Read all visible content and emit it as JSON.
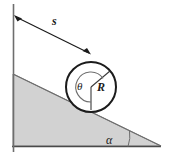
{
  "figure": {
    "kind": "physics-diagram",
    "background_color": "#ffffff",
    "line_color": "#1b1b1b",
    "incline_fill_color": "#d2d2d2",
    "incline_edge_color": "#8a8a8a",
    "labels": {
      "distance": "s",
      "rotation_angle": "θ",
      "radius": "R",
      "incline_angle": "α"
    },
    "geometry": {
      "wall_x": 13,
      "wall_top_y": 4,
      "wall_bottom_y": 152,
      "incline_apex": [
        13,
        74
      ],
      "incline_right_vertex": [
        161,
        146
      ],
      "incline_base_left": [
        13,
        146
      ],
      "disk_center": [
        91,
        87
      ],
      "disk_radius": 25,
      "arrow_start": [
        16,
        17
      ],
      "arrow_end": [
        89,
        53
      ],
      "incline_angle_degrees": 26
    }
  }
}
